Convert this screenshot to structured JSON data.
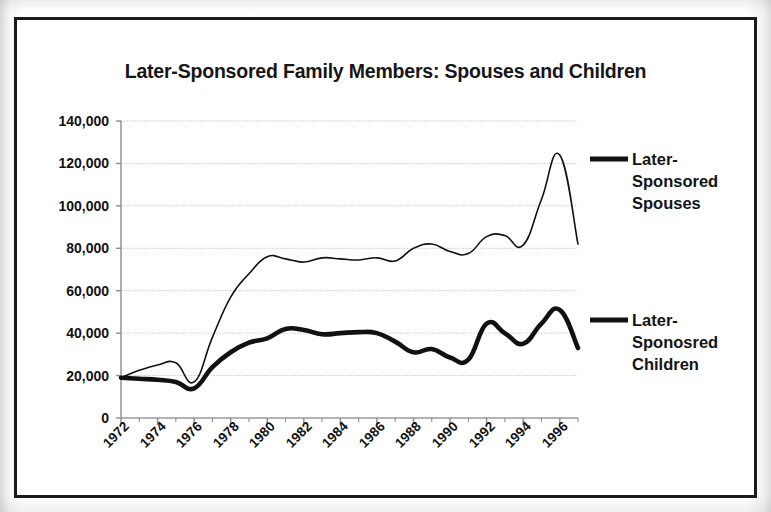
{
  "chart_data": {
    "type": "line",
    "title": "Later-Sponsored Family Members: Spouses and Children",
    "xlabel": "",
    "ylabel": "",
    "xlim": [
      1972,
      1997
    ],
    "ylim": [
      0,
      140000
    ],
    "grid": true,
    "legend_position": "right",
    "ytick_labels": [
      "140,000",
      "120,000",
      "100,000",
      "80,000",
      "60,000",
      "40,000",
      "20,000",
      "0"
    ],
    "ytick_values": [
      140000,
      120000,
      100000,
      80000,
      60000,
      40000,
      20000,
      0
    ],
    "xtick_labels": [
      "1972",
      "1974",
      "1976",
      "1978",
      "1980",
      "1982",
      "1984",
      "1986",
      "1988",
      "1990",
      "1992",
      "1994",
      "1996"
    ],
    "xtick_values": [
      1972,
      1974,
      1976,
      1978,
      1980,
      1982,
      1984,
      1986,
      1988,
      1990,
      1992,
      1994,
      1996
    ],
    "x": [
      1972,
      1973,
      1974,
      1975,
      1976,
      1977,
      1978,
      1979,
      1980,
      1981,
      1982,
      1983,
      1984,
      1985,
      1986,
      1987,
      1988,
      1989,
      1990,
      1991,
      1992,
      1993,
      1994,
      1995,
      1996,
      1997
    ],
    "series": [
      {
        "name": "Later-Sponsored Spouses",
        "legend_label": "Later-\nSponsored\nSpouses",
        "color": "#111111",
        "line_width": 1.6,
        "values": [
          19000,
          22500,
          25000,
          26000,
          17000,
          38000,
          57000,
          68000,
          76000,
          75000,
          73500,
          75500,
          75000,
          74500,
          75500,
          74000,
          80000,
          82000,
          78500,
          77500,
          85500,
          86000,
          81500,
          103000,
          124000,
          82000
        ]
      },
      {
        "name": "Later-Sponosred Children",
        "legend_label": "Later-\nSponosred\nChildren",
        "color": "#111111",
        "line_width": 4.6,
        "values": [
          19000,
          18500,
          18000,
          17000,
          14000,
          24000,
          31000,
          35500,
          37500,
          42000,
          41500,
          39500,
          40000,
          40500,
          40000,
          36000,
          31000,
          32500,
          28500,
          27500,
          44500,
          40000,
          35000,
          44500,
          51000,
          33000
        ]
      }
    ]
  }
}
